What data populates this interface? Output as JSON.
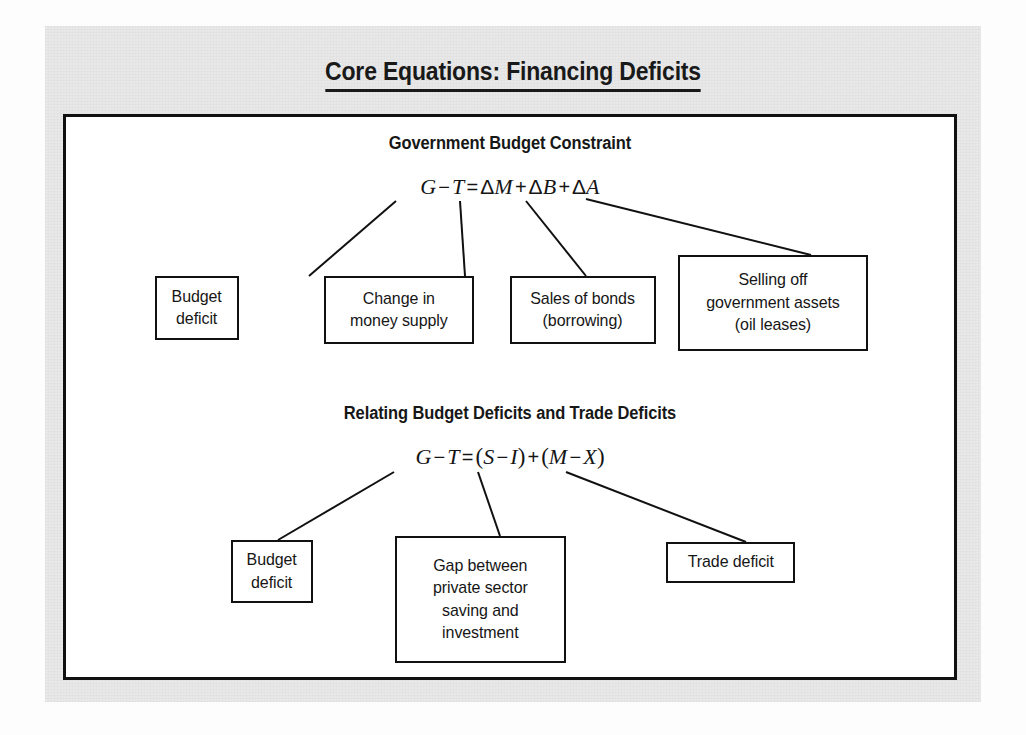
{
  "figure": {
    "title": "Core Equations: Financing Deficits"
  },
  "sections": [
    {
      "heading": "Government Budget Constraint",
      "equation_plain": "G − T = ΔM + ΔB + ΔA",
      "equation_parts": {
        "g": "G",
        "minus1": "−",
        "t": "T",
        "equals": "=",
        "delta1": "Δ",
        "m": "M",
        "plus1": "+",
        "delta2": "Δ",
        "b": "B",
        "plus2": "+",
        "delta3": "Δ",
        "a": "A"
      },
      "nodes": [
        {
          "id": "budget-deficit-1",
          "lines": [
            "Budget",
            "deficit"
          ]
        },
        {
          "id": "change-money-supply",
          "lines": [
            "Change in",
            "money supply"
          ]
        },
        {
          "id": "sales-of-bonds",
          "lines": [
            "Sales of bonds",
            "(borrowing)"
          ]
        },
        {
          "id": "selling-assets",
          "lines": [
            "Selling off",
            "government assets",
            "(oil leases)"
          ]
        }
      ]
    },
    {
      "heading": "Relating Budget Deficits and Trade Deficits",
      "equation_plain": "G − T = (S − I) + (M − X)",
      "equation_parts": {
        "g": "G",
        "minus1": "−",
        "t": "T",
        "equals": "=",
        "lp1": "(",
        "s": "S",
        "minus2": "−",
        "i": "I",
        "rp1": ")",
        "plus": "+",
        "lp2": "(",
        "m": "M",
        "minus3": "−",
        "x": "X",
        "rp2": ")"
      },
      "nodes": [
        {
          "id": "budget-deficit-2",
          "lines": [
            "Budget",
            "deficit"
          ]
        },
        {
          "id": "gap-private-saving",
          "lines": [
            "Gap between",
            "private sector",
            "saving and",
            "investment"
          ]
        },
        {
          "id": "trade-deficit",
          "lines": [
            "Trade deficit"
          ]
        }
      ]
    }
  ],
  "colors": {
    "ink": "#111111",
    "panel": "#e8e8e8",
    "paper": "#ffffff"
  }
}
